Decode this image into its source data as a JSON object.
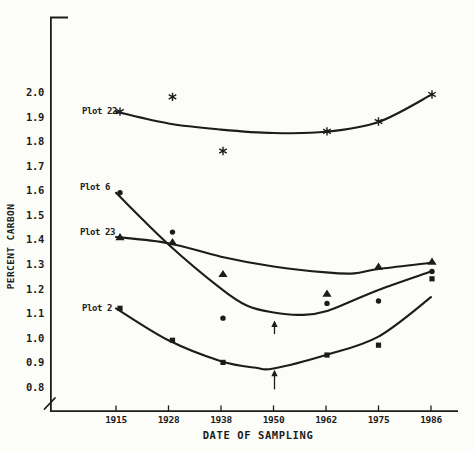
{
  "figure": {
    "background": "#fcfcf9",
    "ink_color": "#1c1c1c"
  },
  "chart_data": {
    "type": "scatter",
    "title": "",
    "xlabel": "DATE OF SAMPLING",
    "ylabel": "PERCENT CARBON",
    "x_tick_years": [
      1915,
      1928,
      1938,
      1950,
      1962,
      1975,
      1986
    ],
    "x_tick_labels": [
      "1915",
      "1928",
      "1938",
      "1950",
      "1962",
      "1975",
      "1986"
    ],
    "y_ticks": [
      2.0,
      1.9,
      1.8,
      1.7,
      1.6,
      1.5,
      1.4,
      1.3,
      1.2,
      1.1,
      1.0,
      0.9,
      0.8
    ],
    "y_tick_labels": [
      "2.0",
      "1.9",
      "1.8",
      "1.7",
      "1.6",
      "1.5",
      "1.4",
      "1.3",
      "1.2",
      "1.1",
      "1.0",
      "0.9",
      "0.8"
    ],
    "ylim": [
      0.8,
      2.05
    ],
    "y_axis_break": true,
    "grid": false,
    "legend_position": "inline-labels-left",
    "series": [
      {
        "name": "Plot 22",
        "marker": "asterisk",
        "points": {
          "x": [
            1915,
            1928,
            1938,
            1962,
            1975,
            1986
          ],
          "y": [
            1.92,
            1.98,
            1.76,
            1.84,
            1.88,
            1.99
          ]
        },
        "curve": {
          "x": [
            1915,
            1928,
            1938,
            1950,
            1962,
            1975,
            1986
          ],
          "y": [
            1.92,
            1.872,
            1.847,
            1.833,
            1.838,
            1.878,
            1.988
          ]
        }
      },
      {
        "name": "Plot 6",
        "marker": "circle",
        "points": {
          "x": [
            1915,
            1928,
            1938,
            1962,
            1975,
            1986
          ],
          "y": [
            1.59,
            1.43,
            1.08,
            1.14,
            1.15,
            1.27
          ]
        },
        "curve": {
          "x": [
            1915,
            1928,
            1938,
            1944,
            1950,
            1956,
            1962,
            1975,
            1986
          ],
          "y": [
            1.59,
            1.38,
            1.2,
            1.13,
            1.103,
            1.093,
            1.108,
            1.195,
            1.27
          ]
        }
      },
      {
        "name": "Plot 23",
        "marker": "triangle",
        "points": {
          "x": [
            1915,
            1928,
            1938,
            1962,
            1975,
            1986
          ],
          "y": [
            1.41,
            1.39,
            1.26,
            1.18,
            1.29,
            1.31
          ]
        },
        "curve": {
          "x": [
            1915,
            1928,
            1938,
            1950,
            1962,
            1969,
            1975,
            1986
          ],
          "y": [
            1.41,
            1.385,
            1.33,
            1.29,
            1.266,
            1.262,
            1.28,
            1.305
          ]
        }
      },
      {
        "name": "Plot 2",
        "marker": "square",
        "points": {
          "x": [
            1915,
            1928,
            1938,
            1962,
            1975,
            1986
          ],
          "y": [
            1.12,
            0.99,
            0.9,
            0.93,
            0.97,
            1.24
          ]
        },
        "curve": {
          "x": [
            1915,
            1928,
            1938,
            1946,
            1950,
            1962,
            1975,
            1986
          ],
          "y": [
            1.12,
            0.99,
            0.905,
            0.878,
            0.875,
            0.93,
            1.005,
            1.165
          ]
        }
      }
    ],
    "annotations": [
      {
        "type": "up-arrow",
        "x": 1950,
        "tip": 1.07,
        "tail": 1.015
      },
      {
        "type": "up-arrow",
        "x": 1950,
        "tip": 0.87,
        "tail": 0.79
      }
    ]
  }
}
